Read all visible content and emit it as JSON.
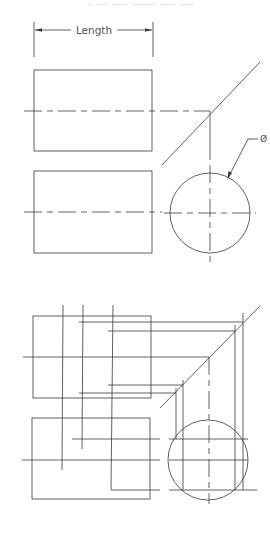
{
  "header_text": "— —— ——— ————— ——— ———",
  "dimension": {
    "label": "Length"
  },
  "diameter_symbol": "Ø",
  "colors": {
    "line": "#3a3a3a",
    "text": "#555555",
    "background": "#ffffff"
  },
  "top_figure": {
    "front_view": {
      "x": 34,
      "y": 70,
      "w": 118,
      "h": 81
    },
    "top_view": {
      "x": 34,
      "y": 171,
      "w": 118,
      "h": 82
    },
    "circle_view": {
      "cx": 210,
      "cy": 213,
      "r": 40
    }
  },
  "bottom_figure": {
    "front_view": {
      "x": 33,
      "y": 316,
      "w": 118,
      "h": 82
    },
    "top_view": {
      "x": 32,
      "y": 418,
      "w": 118,
      "h": 81
    },
    "circle_view": {
      "cx": 208,
      "cy": 460,
      "r": 40
    }
  }
}
